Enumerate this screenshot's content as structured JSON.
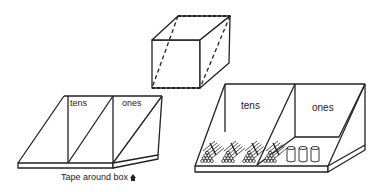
{
  "figure": {
    "cube": {
      "label": "box with dashed cut lines"
    },
    "left_tray": {
      "compartments": [
        "tens",
        "ones"
      ],
      "caption": "Tape around box"
    },
    "right_tray": {
      "compartments": [
        "tens",
        "ones"
      ],
      "tens_contents": "bundles of sticks",
      "ones_contents": "cups",
      "bundle_count": 4,
      "cup_count": 3
    },
    "colors": {
      "line": "#222222",
      "background": "#ffffff"
    }
  }
}
